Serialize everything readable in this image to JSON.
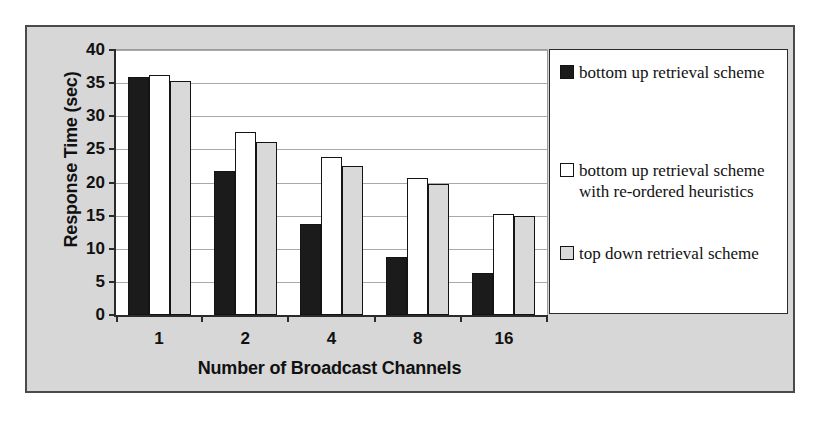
{
  "chart_data": {
    "type": "bar",
    "title": "",
    "xlabel": "Number of Broadcast Channels",
    "ylabel": "Response Time (sec)",
    "categories": [
      "1",
      "2",
      "4",
      "8",
      "16"
    ],
    "ylim": [
      0,
      40
    ],
    "yticks": [
      0,
      5,
      10,
      15,
      20,
      25,
      30,
      35,
      40
    ],
    "grid": true,
    "legend_position": "right",
    "series": [
      {
        "name": "bottom up retrieval scheme",
        "color": "#1b1b1b",
        "values": [
          36.0,
          21.7,
          13.8,
          8.8,
          6.3
        ]
      },
      {
        "name": "bottom up retrieval scheme with re-ordered heuristics",
        "color": "#ffffff",
        "values": [
          36.3,
          27.6,
          23.9,
          20.7,
          15.3
        ]
      },
      {
        "name": "top down retrieval scheme",
        "color": "#d9d9d9",
        "values": [
          35.3,
          26.1,
          22.5,
          19.8,
          15.0
        ]
      }
    ]
  },
  "legend": {
    "entries": [
      {
        "label": "bottom up retrieval scheme",
        "swatch": "black-swatch"
      },
      {
        "label": "bottom up retrieval scheme with re-ordered heuristics",
        "swatch": "white-swatch"
      },
      {
        "label": "top down retrieval scheme",
        "swatch": "gray-swatch"
      }
    ]
  }
}
